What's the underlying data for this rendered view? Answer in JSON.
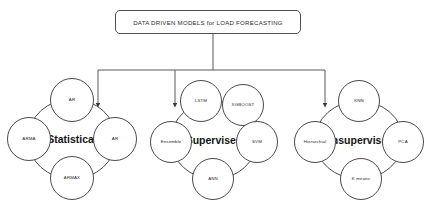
{
  "diagram": {
    "title": "DATA DRIVEN MODELS for LOAD FORECASTING",
    "background_color": "#ffffff",
    "line_color": "#4a4a4a",
    "text_color": "#1f1f1f"
  },
  "clusters": [
    {
      "id": "statistical",
      "center_label": "Statistical",
      "nodes": [
        {
          "id": "ar-top",
          "label": "AR",
          "position": "top"
        },
        {
          "id": "ar-right",
          "label": "AR",
          "position": "right"
        },
        {
          "id": "armax",
          "label": "ARMAX",
          "position": "bottom"
        },
        {
          "id": "arma",
          "label": "ARMA",
          "position": "left"
        }
      ]
    },
    {
      "id": "supervised",
      "center_label": "Supervised",
      "nodes": [
        {
          "id": "lstm",
          "label": "LSTM",
          "position": "top"
        },
        {
          "id": "xgboost",
          "label": "XGBOOST",
          "position": "top-right"
        },
        {
          "id": "svm",
          "label": "SVM",
          "position": "right"
        },
        {
          "id": "ann",
          "label": "ANN",
          "position": "bottom"
        },
        {
          "id": "ensemble",
          "label": "Ensemble",
          "position": "left"
        }
      ]
    },
    {
      "id": "unsupervised",
      "center_label": "Unsupervised",
      "nodes": [
        {
          "id": "knn",
          "label": "KNN",
          "position": "top"
        },
        {
          "id": "pca",
          "label": "PCA",
          "position": "right"
        },
        {
          "id": "kmeans",
          "label": "K means",
          "position": "bottom"
        },
        {
          "id": "hierarchical",
          "label": "Hierarchial",
          "position": "left"
        }
      ]
    }
  ]
}
